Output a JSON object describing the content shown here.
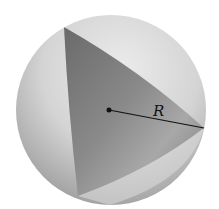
{
  "diagram": {
    "radius_label": "R",
    "colors": {
      "sphere_light": "#e6e6e6",
      "sphere_dark": "#9a9a9a",
      "triangle_dark": "#6e6e6e",
      "triangle_light": "#b4b4b4",
      "line": "#111111"
    }
  }
}
